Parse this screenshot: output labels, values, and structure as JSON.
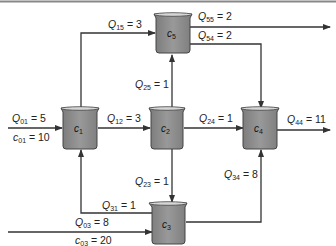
{
  "diagram": {
    "type": "reactor-network",
    "top_border_color": "#888888",
    "colors": {
      "line": "#333333",
      "reactor_fill": "#8c8c8c",
      "reactor_stroke": "#444444",
      "reactor_rim": "#cfcfcf"
    },
    "reactors": [
      {
        "id": "c1",
        "symbol": "c",
        "sub": "1",
        "cx": 80,
        "cy": 128
      },
      {
        "id": "c2",
        "symbol": "c",
        "sub": "2",
        "cx": 166,
        "cy": 128
      },
      {
        "id": "c3",
        "symbol": "c",
        "sub": "3",
        "cx": 167,
        "cy": 224
      },
      {
        "id": "c4",
        "symbol": "c",
        "sub": "4",
        "cx": 259,
        "cy": 128
      },
      {
        "id": "c5",
        "symbol": "c",
        "sub": "5",
        "cx": 172,
        "cy": 33
      }
    ],
    "flows": [
      {
        "id": "Q01",
        "sym": "Q",
        "sub": "01",
        "value": "= 5",
        "from": "inlet",
        "to": "c1"
      },
      {
        "id": "c01",
        "sym": "c",
        "sub": "01",
        "value": "= 10",
        "from": "inlet",
        "to": "c1"
      },
      {
        "id": "Q15",
        "sym": "Q",
        "sub": "15",
        "value": "= 3",
        "from": "c1",
        "to": "c5"
      },
      {
        "id": "Q55",
        "sym": "Q",
        "sub": "55",
        "value": "= 2",
        "from": "c5",
        "to": "outlet"
      },
      {
        "id": "Q54",
        "sym": "Q",
        "sub": "54",
        "value": "= 2",
        "from": "c5",
        "to": "c4"
      },
      {
        "id": "Q25",
        "sym": "Q",
        "sub": "25",
        "value": "= 1",
        "from": "c2",
        "to": "c5"
      },
      {
        "id": "Q12",
        "sym": "Q",
        "sub": "12",
        "value": "= 3",
        "from": "c1",
        "to": "c2"
      },
      {
        "id": "Q24",
        "sym": "Q",
        "sub": "24",
        "value": "= 1",
        "from": "c2",
        "to": "c4"
      },
      {
        "id": "Q44",
        "sym": "Q",
        "sub": "44",
        "value": "= 11",
        "from": "c4",
        "to": "outlet"
      },
      {
        "id": "Q23",
        "sym": "Q",
        "sub": "23",
        "value": "= 1",
        "from": "c2",
        "to": "c3"
      },
      {
        "id": "Q34",
        "sym": "Q",
        "sub": "34",
        "value": "= 8",
        "from": "c3",
        "to": "c4"
      },
      {
        "id": "Q31",
        "sym": "Q",
        "sub": "31",
        "value": "= 1",
        "from": "c3",
        "to": "c1"
      },
      {
        "id": "Q03",
        "sym": "Q",
        "sub": "03",
        "value": "= 8",
        "from": "inlet",
        "to": "c3"
      },
      {
        "id": "c03",
        "sym": "c",
        "sub": "03",
        "value": "= 20",
        "from": "inlet",
        "to": "c3"
      }
    ]
  }
}
